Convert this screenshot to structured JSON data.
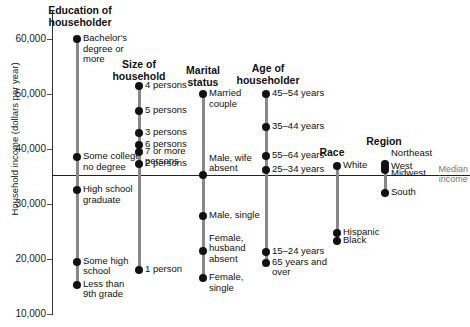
{
  "chart_data": {
    "type": "scatter",
    "title": "",
    "ylabel": "Household income (dollars per year)",
    "xlabel": "",
    "ylim": [
      10000,
      62000
    ],
    "yticks": [
      "10,000",
      "20,000",
      "30,000",
      "40,000",
      "50,000",
      "60,000"
    ],
    "median_income": 35300,
    "median_label": [
      "Median",
      "income"
    ],
    "grid": false,
    "groups": [
      {
        "name": "Education of householder",
        "title_lines": [
          "Education of",
          "householder"
        ],
        "points": [
          {
            "label": "Bachelor's degree or more",
            "value": 60000
          },
          {
            "label": "Some college no degree",
            "value": 38500
          },
          {
            "label": "High school graduate",
            "value": 32500
          },
          {
            "label": "Some high school",
            "value": 19500
          },
          {
            "label": "Less than 9th grade",
            "value": 15300
          }
        ]
      },
      {
        "name": "Size of household",
        "title_lines": [
          "Size of",
          "household"
        ],
        "points": [
          {
            "label": "4 persons",
            "value": 51500
          },
          {
            "label": "5 persons",
            "value": 47000
          },
          {
            "label": "3 persons",
            "value": 43000
          },
          {
            "label": "6 persons",
            "value": 40800
          },
          {
            "label": "7 or more persons",
            "value": 39500
          },
          {
            "label": "2 persons",
            "value": 37300
          },
          {
            "label": "1 person",
            "value": 18000
          }
        ]
      },
      {
        "name": "Marital status",
        "title_lines": [
          "Marital",
          "status"
        ],
        "points": [
          {
            "label": "Married couple",
            "value": 50000
          },
          {
            "label": "Male, wife absent",
            "value": 35300
          },
          {
            "label": "Male, single",
            "value": 27800
          },
          {
            "label": "Female, husband absent",
            "value": 21500
          },
          {
            "label": "Female, single",
            "value": 16500
          }
        ]
      },
      {
        "name": "Age of householder",
        "title_lines": [
          "Age of",
          "householder"
        ],
        "points": [
          {
            "label": "45–54 years",
            "value": 50000
          },
          {
            "label": "35–44 years",
            "value": 44000
          },
          {
            "label": "55–64 years",
            "value": 38800
          },
          {
            "label": "25–34 years",
            "value": 36200
          },
          {
            "label": "15–24 years",
            "value": 21200
          },
          {
            "label": "65 years and over",
            "value": 19300
          }
        ]
      },
      {
        "name": "Race",
        "title_lines": [
          "Race"
        ],
        "points": [
          {
            "label": "White",
            "value": 37000
          },
          {
            "label": "Hispanic",
            "value": 24800
          },
          {
            "label": "Black",
            "value": 23200
          }
        ]
      },
      {
        "name": "Region",
        "title_lines": [
          "Region"
        ],
        "points": [
          {
            "label": "Northeast",
            "value": 37300
          },
          {
            "label": "West",
            "value": 36800
          },
          {
            "label": "Midwest",
            "value": 36200
          },
          {
            "label": "South",
            "value": 32000
          }
        ]
      }
    ]
  }
}
